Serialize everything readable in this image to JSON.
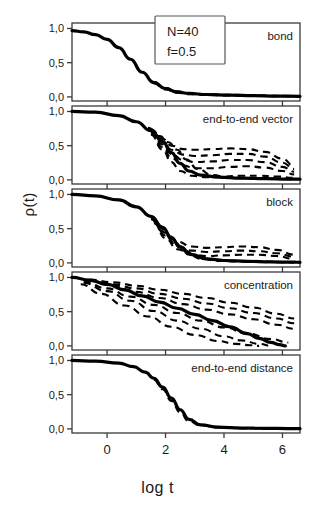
{
  "figure": {
    "ylabel": "ρ(t)",
    "xlabel": "log t",
    "annotation_box": {
      "line1": "N=40",
      "line2": "f=0.5"
    }
  },
  "axes": {
    "ytick_labels": [
      "1,0",
      "0,5",
      "0,0"
    ],
    "ytick_values": [
      1.0,
      0.5,
      0.0
    ],
    "xtick_labels": [
      "0",
      "2",
      "4",
      "6"
    ],
    "xtick_values": [
      0,
      2,
      4,
      6
    ],
    "xlim": [
      -1.2,
      6.6
    ],
    "ylim": [
      -0.06,
      1.08
    ]
  },
  "chart_data": {
    "type": "line",
    "title": "",
    "xlabel": "log t",
    "ylabel": "ρ(t)",
    "xlim": [
      -1.2,
      6.6
    ],
    "ylim": [
      -0.06,
      1.08
    ],
    "grid": false,
    "legend": "none",
    "annotations": [
      "N=40",
      "f=0.5"
    ],
    "panels": [
      {
        "label": "bond",
        "series": [
          {
            "name": "mean-bond",
            "style": "solid",
            "x": [
              -1.2,
              -0.8,
              -0.4,
              0.0,
              0.4,
              0.8,
              1.2,
              1.6,
              2.0,
              2.4,
              2.8,
              3.4,
              4.2,
              5.0,
              5.8,
              6.6
            ],
            "y": [
              0.97,
              0.95,
              0.91,
              0.84,
              0.72,
              0.55,
              0.36,
              0.21,
              0.12,
              0.07,
              0.05,
              0.035,
              0.025,
              0.018,
              0.012,
              0.008
            ]
          },
          {
            "name": "bond-spread-1",
            "style": "dashed",
            "x": [
              1.6,
              2.0,
              2.4,
              2.8,
              3.4,
              4.2,
              5.0,
              5.8,
              6.6
            ],
            "y": [
              0.22,
              0.13,
              0.08,
              0.055,
              0.04,
              0.03,
              0.022,
              0.016,
              0.011
            ]
          },
          {
            "name": "bond-spread-2",
            "style": "dashed",
            "x": [
              1.6,
              2.0,
              2.4,
              2.8,
              3.4,
              4.2,
              5.0,
              5.8,
              6.6
            ],
            "y": [
              0.2,
              0.11,
              0.06,
              0.04,
              0.028,
              0.02,
              0.014,
              0.01,
              0.006
            ]
          }
        ]
      },
      {
        "label": "end-to-end vector",
        "series": [
          {
            "name": "mean-e2e-vector",
            "style": "solid",
            "x": [
              -1.2,
              -0.4,
              0.4,
              1.0,
              1.5,
              1.9,
              2.2,
              2.5,
              2.8,
              3.2,
              3.8,
              4.6,
              5.4,
              6.2,
              6.6
            ],
            "y": [
              1.0,
              0.99,
              0.94,
              0.85,
              0.72,
              0.56,
              0.4,
              0.24,
              0.13,
              0.07,
              0.04,
              0.025,
              0.018,
              0.012,
              0.01
            ]
          },
          {
            "name": "e2e-vector-branch-1",
            "style": "dashed",
            "x": [
              1.5,
              1.9,
              2.2,
              2.6,
              3.0,
              3.6,
              4.2,
              4.8,
              5.4,
              6.0,
              6.4
            ],
            "y": [
              0.74,
              0.6,
              0.5,
              0.45,
              0.44,
              0.45,
              0.46,
              0.45,
              0.41,
              0.31,
              0.2
            ]
          },
          {
            "name": "e2e-vector-branch-2",
            "style": "dashed",
            "x": [
              1.5,
              1.9,
              2.2,
              2.6,
              3.0,
              3.6,
              4.2,
              4.8,
              5.4,
              6.0,
              6.4
            ],
            "y": [
              0.72,
              0.56,
              0.44,
              0.37,
              0.35,
              0.36,
              0.38,
              0.38,
              0.34,
              0.25,
              0.16
            ]
          },
          {
            "name": "e2e-vector-branch-3",
            "style": "dashed",
            "x": [
              1.5,
              1.9,
              2.2,
              2.6,
              3.0,
              3.6,
              4.2,
              4.8,
              5.4,
              6.0,
              6.4
            ],
            "y": [
              0.7,
              0.52,
              0.38,
              0.29,
              0.26,
              0.27,
              0.29,
              0.29,
              0.26,
              0.19,
              0.12
            ]
          },
          {
            "name": "e2e-vector-branch-4",
            "style": "dashed",
            "x": [
              1.5,
              1.9,
              2.2,
              2.6,
              3.0,
              3.6,
              4.2,
              4.8,
              5.4,
              6.0,
              6.4
            ],
            "y": [
              0.68,
              0.48,
              0.32,
              0.21,
              0.17,
              0.17,
              0.19,
              0.2,
              0.18,
              0.13,
              0.08
            ]
          },
          {
            "name": "e2e-vector-branch-5",
            "style": "dashed",
            "x": [
              1.5,
              1.9,
              2.2,
              2.5,
              2.9,
              3.4,
              4.0,
              4.6,
              5.2,
              5.8,
              6.4
            ],
            "y": [
              0.66,
              0.44,
              0.26,
              0.13,
              0.06,
              0.04,
              0.05,
              0.06,
              0.06,
              0.05,
              0.03
            ]
          },
          {
            "name": "e2e-vector-branch-6",
            "style": "dashed",
            "x": [
              1.4,
              1.8,
              2.1,
              2.4,
              2.7,
              3.1,
              3.6,
              4.2,
              5.0,
              5.8,
              6.4
            ],
            "y": [
              0.76,
              0.64,
              0.55,
              0.44,
              0.3,
              0.16,
              0.07,
              0.03,
              0.02,
              0.015,
              0.01
            ]
          }
        ]
      },
      {
        "label": "block",
        "series": [
          {
            "name": "mean-block",
            "style": "solid",
            "x": [
              -1.2,
              -0.4,
              0.4,
              1.0,
              1.5,
              1.9,
              2.2,
              2.5,
              2.9,
              3.4,
              4.0,
              4.8,
              5.6,
              6.4,
              6.6
            ],
            "y": [
              1.0,
              0.98,
              0.92,
              0.82,
              0.68,
              0.52,
              0.37,
              0.23,
              0.12,
              0.06,
              0.035,
              0.022,
              0.015,
              0.01,
              0.009
            ]
          },
          {
            "name": "block-branch-1",
            "style": "dashed",
            "x": [
              1.6,
              2.0,
              2.4,
              2.9,
              3.4,
              4.0,
              4.6,
              5.2,
              5.8,
              6.4
            ],
            "y": [
              0.62,
              0.44,
              0.31,
              0.24,
              0.22,
              0.23,
              0.24,
              0.23,
              0.19,
              0.12
            ]
          },
          {
            "name": "block-branch-2",
            "style": "dashed",
            "x": [
              1.6,
              2.0,
              2.4,
              2.9,
              3.4,
              4.0,
              4.6,
              5.2,
              5.8,
              6.4
            ],
            "y": [
              0.6,
              0.4,
              0.25,
              0.18,
              0.16,
              0.17,
              0.18,
              0.17,
              0.14,
              0.09
            ]
          },
          {
            "name": "block-branch-3",
            "style": "dashed",
            "x": [
              1.6,
              2.0,
              2.4,
              2.9,
              3.4,
              4.0,
              4.6,
              5.2,
              5.8,
              6.4
            ],
            "y": [
              0.58,
              0.36,
              0.2,
              0.12,
              0.1,
              0.11,
              0.12,
              0.12,
              0.1,
              0.06
            ]
          },
          {
            "name": "block-branch-4",
            "style": "dashed",
            "x": [
              1.5,
              1.9,
              2.2,
              2.5,
              2.8,
              3.2,
              3.8,
              4.5,
              5.2,
              6.0,
              6.4
            ],
            "y": [
              0.66,
              0.5,
              0.36,
              0.22,
              0.12,
              0.06,
              0.03,
              0.02,
              0.015,
              0.01,
              0.008
            ]
          },
          {
            "name": "block-branch-5",
            "style": "dashed",
            "x": [
              1.5,
              1.9,
              2.3,
              2.7,
              3.1,
              3.6,
              4.2,
              4.9,
              5.6,
              6.2,
              6.4
            ],
            "y": [
              0.64,
              0.46,
              0.3,
              0.17,
              0.09,
              0.05,
              0.03,
              0.022,
              0.016,
              0.011,
              0.01
            ]
          }
        ]
      },
      {
        "label": "concentration",
        "series": [
          {
            "name": "mean-concentration",
            "style": "solid",
            "x": [
              -1.2,
              -0.6,
              0.0,
              0.6,
              1.2,
              1.8,
              2.4,
              3.0,
              3.6,
              4.2,
              4.8,
              5.2,
              5.6,
              5.9,
              6.1
            ],
            "y": [
              1.0,
              0.96,
              0.9,
              0.82,
              0.73,
              0.64,
              0.55,
              0.46,
              0.37,
              0.28,
              0.18,
              0.11,
              0.05,
              0.02,
              0.0
            ]
          },
          {
            "name": "concentration-branch-1",
            "style": "dashed",
            "x": [
              -0.6,
              0.2,
              1.0,
              1.8,
              2.6,
              3.4,
              4.2,
              5.0,
              5.8,
              6.4
            ],
            "y": [
              0.97,
              0.93,
              0.88,
              0.82,
              0.76,
              0.7,
              0.63,
              0.56,
              0.47,
              0.4
            ]
          },
          {
            "name": "concentration-branch-2",
            "style": "dashed",
            "x": [
              -0.6,
              0.2,
              1.0,
              1.8,
              2.6,
              3.4,
              4.2,
              5.0,
              5.8,
              6.4
            ],
            "y": [
              0.96,
              0.9,
              0.84,
              0.76,
              0.69,
              0.62,
              0.55,
              0.48,
              0.4,
              0.33
            ]
          },
          {
            "name": "concentration-branch-3",
            "style": "dashed",
            "x": [
              -0.6,
              0.2,
              1.0,
              1.8,
              2.6,
              3.4,
              4.2,
              5.0,
              5.8,
              6.4
            ],
            "y": [
              0.95,
              0.88,
              0.79,
              0.7,
              0.61,
              0.53,
              0.46,
              0.39,
              0.31,
              0.25
            ]
          },
          {
            "name": "concentration-branch-4",
            "style": "dashed",
            "x": [
              -0.8,
              0.0,
              0.8,
              1.6,
              2.4,
              3.2,
              4.0,
              4.8,
              5.6,
              6.2
            ],
            "y": [
              0.94,
              0.84,
              0.72,
              0.6,
              0.48,
              0.37,
              0.27,
              0.18,
              0.1,
              0.05
            ]
          },
          {
            "name": "concentration-branch-5",
            "style": "dashed",
            "x": [
              -0.8,
              0.0,
              0.8,
              1.6,
              2.4,
              3.2,
              4.0,
              4.6,
              5.2,
              5.6
            ],
            "y": [
              0.92,
              0.8,
              0.66,
              0.51,
              0.37,
              0.25,
              0.14,
              0.08,
              0.03,
              0.0
            ]
          },
          {
            "name": "concentration-branch-6",
            "style": "dashed",
            "x": [
              -0.9,
              -0.2,
              0.6,
              1.4,
              2.2,
              3.0,
              3.8,
              4.4,
              4.9,
              5.2
            ],
            "y": [
              0.9,
              0.76,
              0.59,
              0.43,
              0.28,
              0.16,
              0.07,
              0.03,
              0.01,
              0.0
            ]
          }
        ]
      },
      {
        "label": "end-to-end distance",
        "series": [
          {
            "name": "mean-e2e-distance",
            "style": "solid",
            "x": [
              -1.2,
              -0.4,
              0.4,
              0.9,
              1.3,
              1.6,
              1.9,
              2.2,
              2.5,
              2.8,
              3.2,
              3.8,
              4.6,
              5.4,
              6.2,
              6.6
            ],
            "y": [
              1.0,
              0.99,
              0.96,
              0.91,
              0.83,
              0.74,
              0.61,
              0.45,
              0.28,
              0.14,
              0.06,
              0.025,
              0.012,
              0.008,
              0.005,
              0.004
            ]
          },
          {
            "name": "e2e-distance-spread",
            "style": "dashed",
            "x": [
              1.6,
              1.9,
              2.2,
              2.5,
              2.8,
              3.2,
              3.8,
              4.6,
              5.4,
              6.2
            ],
            "y": [
              0.72,
              0.58,
              0.41,
              0.24,
              0.11,
              0.05,
              0.02,
              0.01,
              0.007,
              0.004
            ]
          }
        ]
      }
    ]
  }
}
